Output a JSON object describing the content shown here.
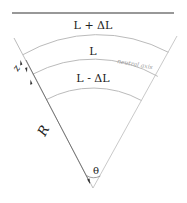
{
  "diagram": {
    "labels": {
      "outer": "L + ΔL",
      "middle": "L",
      "inner": "L - ΔL",
      "neutral_axis": "neutral axis",
      "z": "z",
      "radius": "R",
      "angle": "θ"
    },
    "colors": {
      "top_line": "#333333",
      "arcs": "#bbbbbb",
      "edges": "#aaaaaa",
      "text": "#222222",
      "neutral_axis_text": "#9a9a9a"
    }
  }
}
